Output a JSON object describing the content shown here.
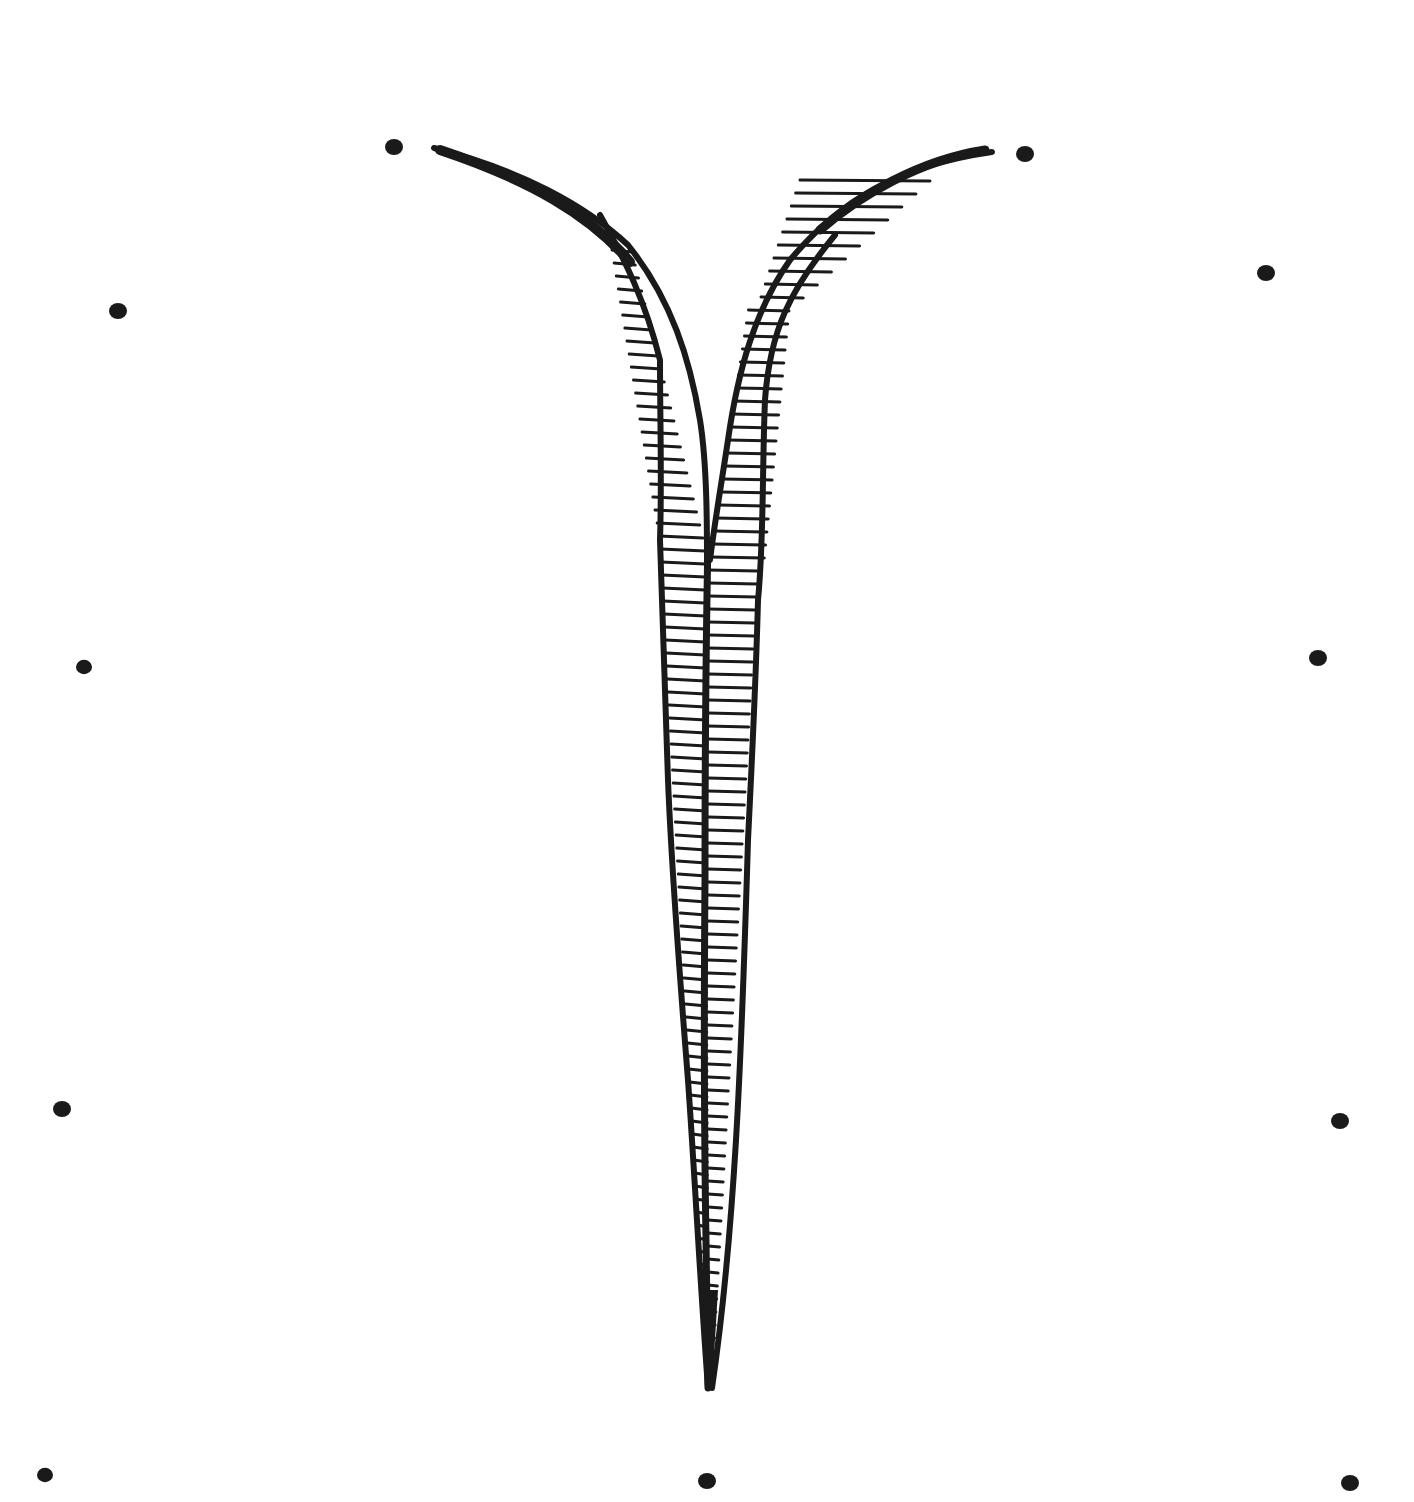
{
  "artwork": {
    "subject": "hand-drawn ink illustration of two hatched strokes joining into a single tapering spike, surrounded by dots",
    "background": "#ffffff",
    "ink": "#1a1a1a"
  },
  "dots": [
    {
      "x": 394,
      "y": 147,
      "r": 9
    },
    {
      "x": 1025,
      "y": 154,
      "r": 9
    },
    {
      "x": 118,
      "y": 311,
      "r": 9
    },
    {
      "x": 1266,
      "y": 273,
      "r": 9
    },
    {
      "x": 84,
      "y": 667,
      "r": 8
    },
    {
      "x": 1318,
      "y": 658,
      "r": 9
    },
    {
      "x": 62,
      "y": 1109,
      "r": 9
    },
    {
      "x": 1340,
      "y": 1121,
      "r": 9
    },
    {
      "x": 45,
      "y": 1475,
      "r": 8
    },
    {
      "x": 707,
      "y": 1481,
      "r": 9
    },
    {
      "x": 1350,
      "y": 1483,
      "r": 9
    }
  ]
}
